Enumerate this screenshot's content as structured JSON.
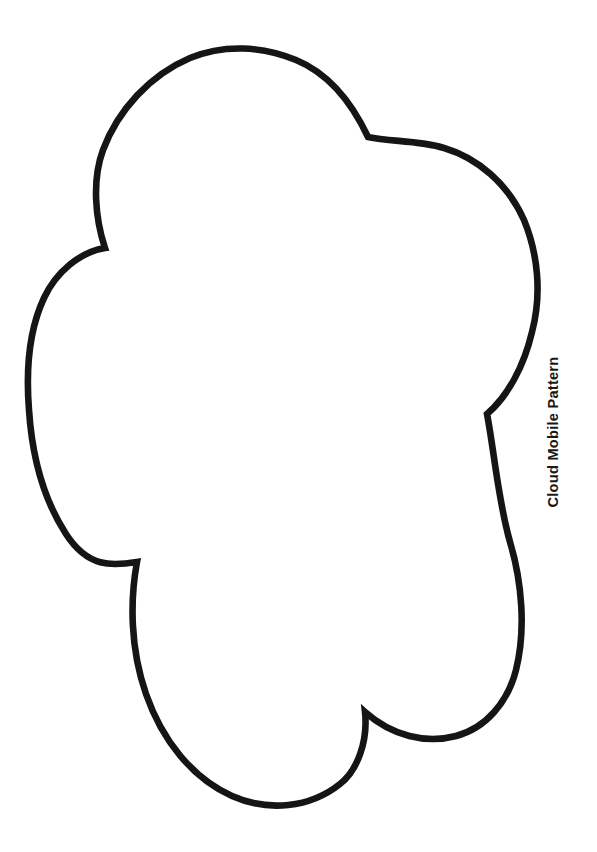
{
  "page": {
    "background_color": "#ffffff",
    "width": 597,
    "height": 852
  },
  "caption": {
    "text": "Cloud Mobile Pattern",
    "rotation_degrees": -90,
    "color": "#181818"
  },
  "shape": {
    "name": "cloud-outline",
    "kind": "closed-outline",
    "fill_color": "#ffffff",
    "stroke_color": "#151515",
    "stroke_width": 6.6,
    "lobe_count": 6,
    "cusp_count": 5,
    "cusps": [
      {
        "label": "top-middle-cusp",
        "x": 368,
        "y": 137
      },
      {
        "label": "right-middle-cusp",
        "x": 487,
        "y": 414
      },
      {
        "label": "bottom-middle-cusp",
        "x": 365,
        "y": 712
      },
      {
        "label": "left-lower-cusp",
        "x": 137,
        "y": 562
      },
      {
        "label": "left-upper-cusp",
        "x": 105,
        "y": 248
      }
    ],
    "extremes": {
      "topmost": {
        "x": 215,
        "y": 48
      },
      "leftmost": {
        "x": 29,
        "y": 410
      },
      "rightmost": {
        "x": 537,
        "y": 280
      },
      "bottommost": {
        "x": 280,
        "y": 804
      }
    },
    "path": "M 368 137 C 352 103 330 74 296 60 C 262 46 224 44 190 58 C 150 75 118 110 103 150 C 92 180 95 218 105 248 C 80 252 56 272 44 298 C 28 332 26 372 29 410 C 32 456 44 500 66 534 C 88 568 112 566 137 562 C 130 600 130 648 146 694 C 162 740 192 778 232 796 C 268 812 310 808 340 784 C 358 770 368 740 365 712 C 392 736 426 744 456 736 C 486 728 508 702 516 670 C 526 630 522 582 510 542 C 498 500 494 450 487 414 C 508 396 524 366 532 332 C 542 294 538 254 524 220 C 508 184 478 158 444 148 C 418 140 390 142 368 137 Z"
  }
}
